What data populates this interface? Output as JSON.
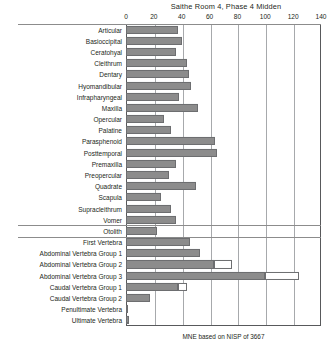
{
  "chart_data": {
    "type": "bar",
    "orientation": "horizontal",
    "title": "Saithe Room 4, Phase 4 Midden",
    "xlabel": "",
    "ylabel": "",
    "xlim": [
      0,
      140
    ],
    "xticks": [
      0,
      20,
      40,
      60,
      80,
      100,
      120,
      140
    ],
    "xtick_labels": [
      "0",
      "20",
      "40",
      "60",
      "80",
      "100",
      "120",
      "140"
    ],
    "grid": true,
    "legend": "none",
    "footnote": "MNE based on NISP of 3667",
    "categories": [
      "Articular",
      "Basioccipital",
      "Ceratohyal",
      "Cleithrum",
      "Dentary",
      "Hyomandibular",
      "Infrapharyngeal",
      "Maxilla",
      "Opercular",
      "Palatine",
      "Parasphenoid",
      "Posttemporal",
      "Premaxilla",
      "Preopercular",
      "Quadrate",
      "Scapula",
      "Supracleithrum",
      "Vomer",
      "Otolith",
      "First Vertebra",
      "Abdominal Vertebra Group 1",
      "Abdominal Vertebra Group 2",
      "Abdominal Vertebra Group 3",
      "Caudal Vertebra Group 1",
      "Caudal Vertebra Group 2",
      "Penultimate Vertebra",
      "Ultimate Vertebra"
    ],
    "values": [
      37,
      40,
      36,
      44,
      45,
      47,
      38,
      52,
      27,
      32,
      64,
      65,
      36,
      31,
      50,
      25,
      32,
      36,
      22,
      46,
      53,
      63,
      100,
      37,
      17,
      1,
      2
    ],
    "secondary_values": [
      0,
      0,
      0,
      0,
      0,
      0,
      0,
      0,
      0,
      0,
      0,
      0,
      0,
      0,
      0,
      0,
      0,
      0,
      0,
      0,
      0,
      76,
      124,
      44,
      0,
      0,
      0
    ],
    "group_separators_after": [
      "Vomer",
      "Otolith"
    ],
    "colors": {
      "bar_fill": "#8c8c8c",
      "bar_stroke": "#6d6e70",
      "secondary_fill": "#ffffff",
      "gridline": "#a7a9ac",
      "axis": "#58595b",
      "text": "#231f20"
    }
  }
}
